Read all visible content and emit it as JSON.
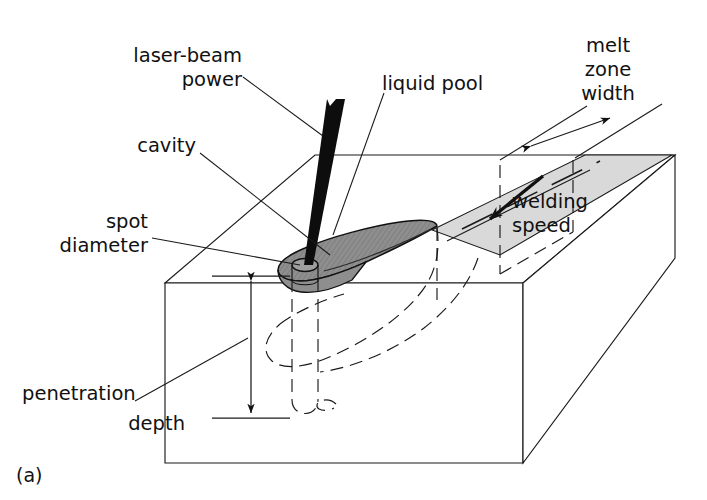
{
  "figure": {
    "caption": "(a)",
    "type": "technical-line-diagram"
  },
  "labels": {
    "laser_beam_power_line1": "laser-beam",
    "laser_beam_power_line2": "power",
    "cavity": "cavity",
    "spot_diameter_line1": "spot",
    "spot_diameter_line2": "diameter",
    "penetration_depth_line1": "penetration",
    "penetration_depth_line2": "depth",
    "liquid_pool": "liquid pool",
    "melt_zone_width_line1": "melt",
    "melt_zone_width_line2": "zone",
    "melt_zone_width_line3": "width",
    "welding_speed_line1": "welding",
    "welding_speed_line2": "speed"
  },
  "colors": {
    "ink": "#111111",
    "line": "#1a1a1a",
    "beam_fill": "#0d0d0d",
    "liquid_pool_fill": "#9a9a9a",
    "liquid_pool_fill_dark": "#8a8a8a",
    "melt_zone_fill": "#d9d9d9",
    "background": "#ffffff"
  }
}
